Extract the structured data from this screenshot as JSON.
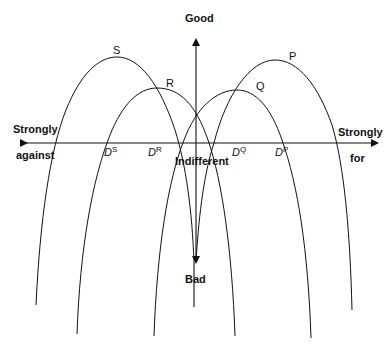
{
  "axes": {
    "vertical_top": "Good",
    "vertical_bottom": "Bad",
    "horizontal_left_line1": "Strongly",
    "horizontal_left_line2": "against",
    "horizontal_right_line1": "Strongly",
    "horizontal_right_line2": "for",
    "center": "Indifferent"
  },
  "curves": [
    {
      "name": "S",
      "peak": [
        117,
        57
      ]
    },
    {
      "name": "R",
      "peak": [
        157,
        88
      ]
    },
    {
      "name": "Q",
      "peak": [
        237,
        90
      ]
    },
    {
      "name": "P",
      "peak": [
        275,
        60
      ]
    }
  ],
  "ideal_points": [
    {
      "base": "D",
      "sup": "S"
    },
    {
      "base": "D",
      "sup": "R"
    },
    {
      "base": "D",
      "sup": "Q"
    },
    {
      "base": "D",
      "sup": "P"
    }
  ],
  "colors": {
    "line": "#111111",
    "background": "#ffffff"
  }
}
